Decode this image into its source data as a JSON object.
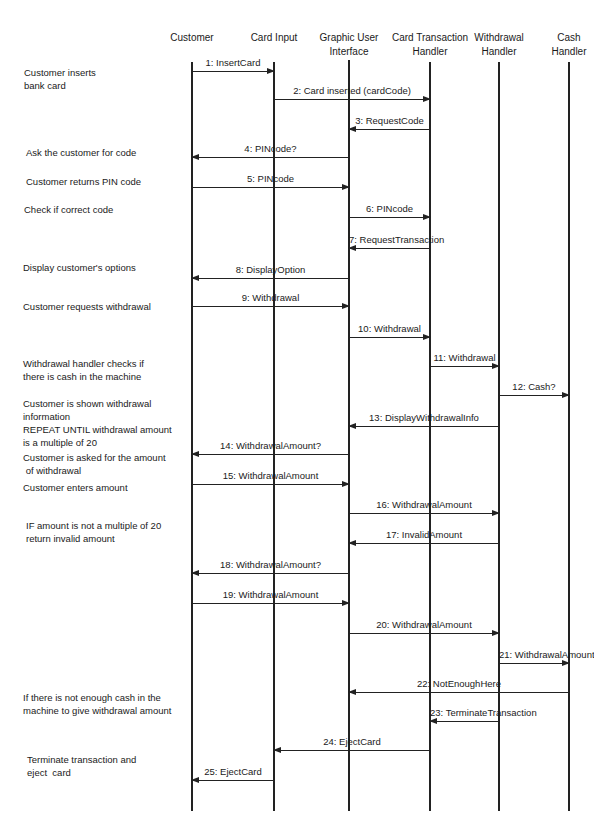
{
  "diagram": {
    "type": "sequence",
    "participants": [
      {
        "id": "customer",
        "label": "Customer",
        "x": 192,
        "top": 62
      },
      {
        "id": "card-input",
        "label": "Card Input",
        "x": 274,
        "top": 62
      },
      {
        "id": "gui",
        "label": "Graphic User\nInterface",
        "x": 349,
        "top": 60
      },
      {
        "id": "card-transaction-handler",
        "label": "Card Transaction\nHandler",
        "x": 430,
        "top": 62
      },
      {
        "id": "withdrawal-handler",
        "label": "Withdrawal\nHandler",
        "x": 499,
        "top": 62
      },
      {
        "id": "cash-handler",
        "label": "Cash\nHandler",
        "x": 569,
        "top": 62
      }
    ],
    "lifeline_bottom": 811,
    "messages": [
      {
        "n": 1,
        "label": "1: InsertCard",
        "from": 0,
        "to": 1,
        "y": 71
      },
      {
        "n": 2,
        "label": "2: Card inserted (cardCode)",
        "from": 1,
        "to": 3,
        "y": 99
      },
      {
        "n": 3,
        "label": "3: RequestCode",
        "from": 3,
        "to": 2,
        "y": 129
      },
      {
        "n": 4,
        "label": "4: PINcode?",
        "from": 2,
        "to": 0,
        "y": 157
      },
      {
        "n": 5,
        "label": "5: PINcode",
        "from": 0,
        "to": 2,
        "y": 187
      },
      {
        "n": 6,
        "label": "6: PINcode",
        "from": 2,
        "to": 3,
        "y": 217
      },
      {
        "n": 7,
        "label": "7: RequestTransaction",
        "from": 3,
        "to": 2,
        "y": 248
      },
      {
        "n": 8,
        "label": "8: DisplayOption",
        "from": 2,
        "to": 0,
        "y": 278
      },
      {
        "n": 9,
        "label": "9: Withdrawal",
        "from": 0,
        "to": 2,
        "y": 306
      },
      {
        "n": 10,
        "label": "10: Withdrawal",
        "from": 2,
        "to": 3,
        "y": 337
      },
      {
        "n": 11,
        "label": "11: Withdrawal",
        "from": 3,
        "to": 4,
        "y": 366
      },
      {
        "n": 12,
        "label": "12: Cash?",
        "from": 4,
        "to": 5,
        "y": 395
      },
      {
        "n": 13,
        "label": "13: DisplayWithdrawalInfo",
        "from": 4,
        "to": 2,
        "y": 426
      },
      {
        "n": 14,
        "label": "14: WithdrawalAmount?",
        "from": 2,
        "to": 0,
        "y": 454
      },
      {
        "n": 15,
        "label": "15: WithdrawalAmount",
        "from": 0,
        "to": 2,
        "y": 484
      },
      {
        "n": 16,
        "label": "16: WithdrawalAmount",
        "from": 2,
        "to": 4,
        "y": 513
      },
      {
        "n": 17,
        "label": "17: InvalidAmount",
        "from": 4,
        "to": 2,
        "y": 543
      },
      {
        "n": 18,
        "label": "18: WithdrawalAmount?",
        "from": 2,
        "to": 0,
        "y": 573
      },
      {
        "n": 19,
        "label": "19: WithdrawalAmount",
        "from": 0,
        "to": 2,
        "y": 603
      },
      {
        "n": 20,
        "label": "20: WithdrawalAmount",
        "from": 2,
        "to": 4,
        "y": 633
      },
      {
        "n": 21,
        "label": "21: WithdrawalAmount",
        "from": 4,
        "to": 5,
        "y": 663
      },
      {
        "n": 22,
        "label": "22: NotEnoughHere",
        "from": 5,
        "to": 2,
        "y": 692
      },
      {
        "n": 23,
        "label": "23: TerminateTransaction",
        "from": 4,
        "to": 3,
        "y": 721
      },
      {
        "n": 24,
        "label": "24: EjectCard",
        "from": 3,
        "to": 1,
        "y": 750
      },
      {
        "n": 25,
        "label": "25: EjectCard",
        "from": 1,
        "to": 0,
        "y": 780
      }
    ],
    "notes": [
      {
        "lines": [
          "Customer inserts",
          "bank card"
        ],
        "x": 24,
        "y": 66
      },
      {
        "lines": [
          "Ask the customer for code"
        ],
        "x": 26,
        "y": 146
      },
      {
        "lines": [
          "Customer returns PIN code"
        ],
        "x": 26,
        "y": 175
      },
      {
        "lines": [
          "Check if correct code"
        ],
        "x": 24,
        "y": 203
      },
      {
        "lines": [
          "Display customer's options"
        ],
        "x": 23,
        "y": 261
      },
      {
        "lines": [
          "Customer requests withdrawal"
        ],
        "x": 23,
        "y": 300
      },
      {
        "lines": [
          "Withdrawal handler checks if",
          "there is cash in the machine"
        ],
        "x": 23,
        "y": 357
      },
      {
        "lines": [
          "Customer is shown withdrawal",
          "information",
          "REPEAT UNTIL withdrawal amount",
          "is a multiple of 20"
        ],
        "x": 23,
        "y": 397
      },
      {
        "lines": [
          "Customer is asked for the amount",
          " of withdrawal"
        ],
        "x": 23,
        "y": 451
      },
      {
        "lines": [
          "Customer enters amount"
        ],
        "x": 23,
        "y": 481
      },
      {
        "lines": [
          "IF amount is not a multiple of 20",
          "return invalid amount"
        ],
        "x": 26,
        "y": 519
      },
      {
        "lines": [
          "If there is not enough cash in the",
          "machine to give withdrawal amount"
        ],
        "x": 23,
        "y": 691
      },
      {
        "lines": [
          "Terminate transaction and",
          "eject  card"
        ],
        "x": 27,
        "y": 753
      }
    ]
  }
}
